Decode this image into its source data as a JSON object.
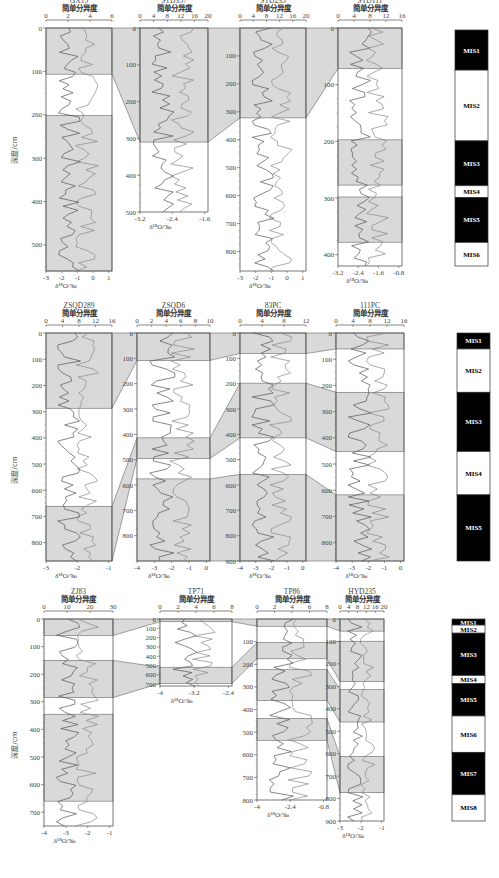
{
  "common": {
    "top_axis_label": "简单分异度",
    "bottom_axis_label": "δ¹⁸O/‰",
    "depth_label": "深度/cm",
    "shade_color": "#d9d9d9",
    "line_color": "#555555"
  },
  "chart_data": [
    {
      "type": "line",
      "row": 1,
      "cores": [
        {
          "name": "GX15",
          "top_ticks": [
            "0",
            "2",
            "4",
            "6"
          ],
          "bottom_ticks": [
            "-3",
            "-2",
            "-1",
            "0",
            "1"
          ],
          "depth_ticks": [
            "0",
            "100",
            "200",
            "300",
            "400",
            "500"
          ],
          "depth_range": [
            0,
            560
          ]
        },
        {
          "name": "STD357",
          "top_ticks": [
            "0",
            "4",
            "8",
            "12",
            "16",
            "20"
          ],
          "bottom_ticks": [
            "-3.2",
            "-2.4",
            "-1.6"
          ],
          "depth_ticks": [
            "0",
            "100",
            "200",
            "300",
            "400",
            "500"
          ],
          "depth_range": [
            0,
            500
          ]
        },
        {
          "name": "STD235",
          "top_ticks": [
            "0",
            "4",
            "8",
            "12",
            "16",
            "20"
          ],
          "bottom_ticks": [
            "-3",
            "-2",
            "-1",
            "0",
            "1"
          ],
          "depth_ticks": [
            "100",
            "200",
            "300",
            "400",
            "500",
            "600",
            "700",
            "800"
          ],
          "depth_range": [
            0,
            870
          ]
        },
        {
          "name": "STD111",
          "top_ticks": [
            "0",
            "4",
            "8",
            "12",
            "16"
          ],
          "bottom_ticks": [
            "-3.2",
            "-2.4",
            "-1.6",
            "-0.8"
          ],
          "depth_ticks": [
            "0",
            "100",
            "200",
            "300",
            "400"
          ],
          "depth_range": [
            0,
            420
          ]
        }
      ],
      "mis": [
        "MIS1",
        "MIS2",
        "MIS3",
        "MIS4",
        "MIS5",
        "MIS6"
      ]
    },
    {
      "type": "line",
      "row": 2,
      "cores": [
        {
          "name": "ZSQD289",
          "top_ticks": [
            "0",
            "4",
            "8",
            "12",
            "16"
          ],
          "bottom_ticks": [
            "-3",
            "-2",
            "-1"
          ],
          "depth_ticks": [
            "0",
            "100",
            "200",
            "300",
            "400",
            "500",
            "600",
            "700",
            "800"
          ],
          "depth_range": [
            0,
            870
          ]
        },
        {
          "name": "ZSQD6",
          "top_ticks": [
            "0",
            "2",
            "4",
            "6",
            "8",
            "10"
          ],
          "bottom_ticks": [
            "-4",
            "-3",
            "-2",
            "-1",
            "0"
          ],
          "depth_ticks": [
            "0",
            "100",
            "200",
            "300",
            "400",
            "500",
            "600",
            "700",
            "800"
          ],
          "depth_range": [
            0,
            900
          ]
        },
        {
          "name": "83PC",
          "top_ticks": [
            "0",
            "4",
            "8",
            "12"
          ],
          "bottom_ticks": [
            "-4",
            "-3",
            "-2",
            "-1",
            "0"
          ],
          "depth_ticks": [
            "0",
            "100",
            "200",
            "300",
            "400",
            "500",
            "600",
            "700",
            "800",
            "900"
          ],
          "depth_range": [
            0,
            900
          ]
        },
        {
          "name": "111PC",
          "top_ticks": [
            "0",
            "4",
            "8",
            "12",
            "16"
          ],
          "bottom_ticks": [
            "-4",
            "-3",
            "-2",
            "-1",
            "0"
          ],
          "depth_ticks": [
            "0",
            "100",
            "200",
            "300",
            "400",
            "500",
            "600",
            "700",
            "800"
          ],
          "depth_range": [
            0,
            870
          ]
        }
      ],
      "mis": [
        "MIS1",
        "MIS2",
        "MIS3",
        "MIS4",
        "MIS5"
      ]
    },
    {
      "type": "line",
      "row": 3,
      "cores": [
        {
          "name": "ZJ83",
          "top_ticks": [
            "0",
            "10",
            "20",
            "30"
          ],
          "bottom_ticks": [
            "-4",
            "-3",
            "-2",
            "-1"
          ],
          "depth_ticks": [
            "0",
            "100",
            "200",
            "300",
            "400",
            "500",
            "600",
            "700"
          ],
          "depth_range": [
            0,
            750
          ]
        },
        {
          "name": "TP71",
          "top_ticks": [
            "0",
            "2",
            "4",
            "6",
            "8"
          ],
          "bottom_ticks": [
            "-4",
            "-3.2",
            "-2.4"
          ],
          "depth_ticks": [
            "0",
            "100",
            "200",
            "300",
            "400",
            "500",
            "600",
            "700"
          ],
          "depth_range": [
            0,
            720
          ]
        },
        {
          "name": "TP86",
          "top_ticks": [
            "0",
            "2",
            "4",
            "6",
            "8"
          ],
          "bottom_ticks": [
            "-4",
            "-2.4",
            "-0.8"
          ],
          "depth_ticks": [
            "100",
            "200",
            "300",
            "400",
            "500",
            "600",
            "700",
            "800"
          ],
          "depth_range": [
            0,
            800
          ]
        },
        {
          "name": "HYD235",
          "top_ticks": [
            "0",
            "4",
            "8",
            "12",
            "16",
            "20"
          ],
          "bottom_ticks": [
            "-3",
            "-2",
            "-1"
          ],
          "depth_ticks": [
            "0",
            "100",
            "200",
            "300",
            "400",
            "500",
            "600",
            "700",
            "800",
            "900"
          ],
          "depth_range": [
            0,
            900
          ]
        }
      ],
      "mis": [
        "MIS1",
        "MIS2",
        "MIS3",
        "MIS4",
        "MIS5",
        "MIS6",
        "MIS7",
        "MIS8"
      ]
    }
  ]
}
